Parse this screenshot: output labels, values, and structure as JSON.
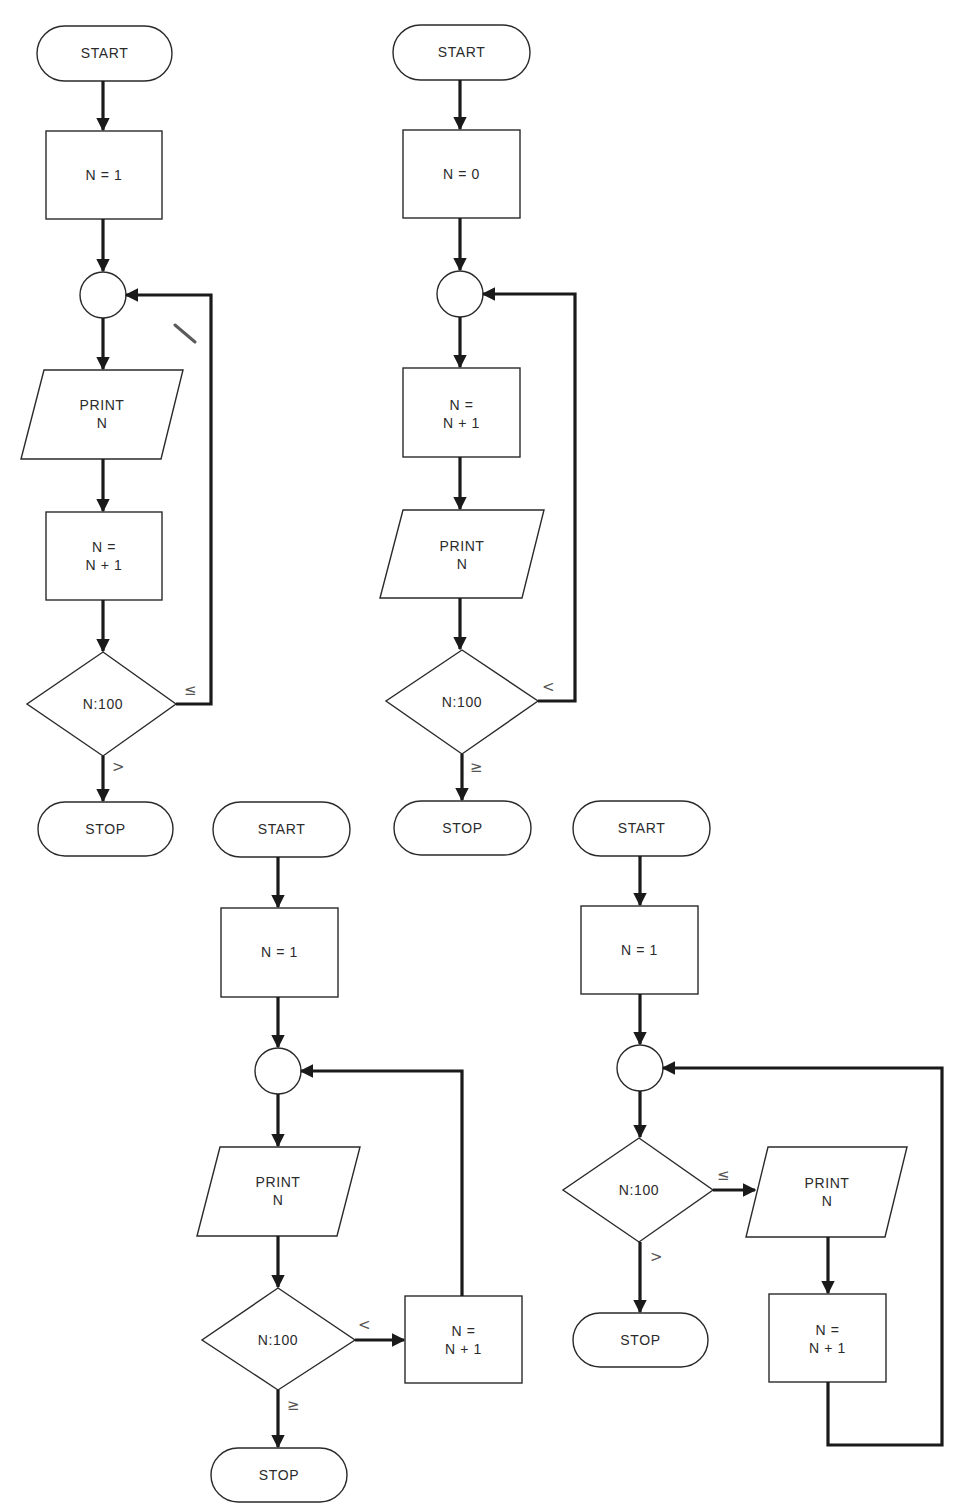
{
  "figure": {
    "top_caption_cutoff": "",
    "colors": {
      "line": "#1a1a1a",
      "shape_border": "#2a2a2a",
      "text": "#2b2b2b",
      "background": "#ffffff"
    }
  },
  "flowcharts": [
    {
      "id": "flowchart-1",
      "start": "START",
      "init": "N = 1",
      "print_line1": "PRINT",
      "print_line2": "N",
      "increment_line1": "N =",
      "increment_line2": "N + 1",
      "decision": "N:100",
      "loop_condition": "≤",
      "exit_condition": ">",
      "stop": "STOP",
      "order": [
        "START",
        "N = 1",
        "connector",
        "PRINT N",
        "N = N + 1",
        "N:100",
        "STOP"
      ]
    },
    {
      "id": "flowchart-2",
      "start": "START",
      "init": "N = 0",
      "increment_line1": "N =",
      "increment_line2": "N + 1",
      "print_line1": "PRINT",
      "print_line2": "N",
      "decision": "N:100",
      "loop_condition": "<",
      "exit_condition": "≥",
      "stop": "STOP",
      "order": [
        "START",
        "N = 0",
        "connector",
        "N = N + 1",
        "PRINT N",
        "N:100",
        "STOP"
      ]
    },
    {
      "id": "flowchart-3",
      "start": "START",
      "init": "N = 1",
      "print_line1": "PRINT",
      "print_line2": "N",
      "decision": "N:100",
      "loop_condition": "<",
      "exit_condition": "≥",
      "increment_line1": "N =",
      "increment_line2": "N + 1",
      "stop": "STOP",
      "order": [
        "START",
        "N = 1",
        "connector",
        "PRINT N",
        "N:100",
        "N = N + 1 (right branch)",
        "STOP"
      ]
    },
    {
      "id": "flowchart-4",
      "start": "START",
      "init": "N = 1",
      "decision": "N:100",
      "loop_condition": "≤",
      "exit_condition": ">",
      "print_line1": "PRINT",
      "print_line2": "N",
      "increment_line1": "N =",
      "increment_line2": "N + 1",
      "stop": "STOP",
      "order": [
        "START",
        "N = 1",
        "connector",
        "N:100",
        "PRINT N (right branch)",
        "N = N + 1 (right branch)",
        "STOP"
      ]
    }
  ]
}
